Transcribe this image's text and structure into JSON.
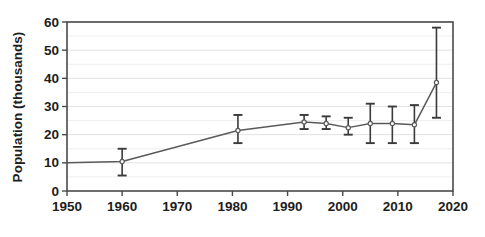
{
  "chart_data": {
    "type": "line",
    "title": "",
    "xlabel": "",
    "ylabel": "Population (thousands)",
    "xlim": [
      1950,
      2020
    ],
    "ylim": [
      0,
      60
    ],
    "xticks": [
      1950,
      1960,
      1970,
      1980,
      1990,
      2000,
      2010,
      2020
    ],
    "yticks": [
      0,
      10,
      20,
      30,
      40,
      50,
      60
    ],
    "xtick_labels": [
      "1950",
      "1960",
      "1970",
      "1980",
      "1990",
      "2000",
      "2010",
      "2020"
    ],
    "ytick_labels": [
      "0",
      "10",
      "20",
      "30",
      "40",
      "50",
      "60"
    ],
    "grid": true,
    "grid_axis": "y",
    "grid_minor_step": 5,
    "legend": null,
    "series": [
      {
        "name": "Population estimate",
        "marker": "open-circle",
        "line_color": "#5a5a5a",
        "error_bar_color": "#3a3a3a",
        "x": [
          1950,
          1960,
          1981,
          1993,
          1997,
          2001,
          2005,
          2009,
          2013,
          2017
        ],
        "values": [
          10.0,
          10.5,
          21.5,
          24.5,
          24.0,
          22.5,
          24.0,
          24.0,
          23.5,
          38.5
        ],
        "error_low": [
          null,
          5.5,
          17.0,
          22.0,
          22.0,
          20.0,
          17.0,
          17.0,
          17.0,
          26.0
        ],
        "error_high": [
          null,
          15.0,
          27.0,
          27.0,
          26.5,
          26.0,
          31.0,
          30.0,
          30.5,
          58.0
        ]
      }
    ]
  },
  "axes": {
    "y_axis_title": "Population (thousands)"
  }
}
